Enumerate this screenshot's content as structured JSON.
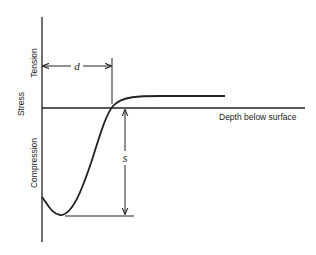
{
  "diagram": {
    "y_axis": {
      "label": "Stress",
      "upper_label": "Tension",
      "lower_label": "Compression"
    },
    "x_axis": {
      "label": "Depth below surface"
    },
    "dimensions": {
      "depth_symbol": "d",
      "stress_symbol": "s"
    },
    "line_color": "#222222",
    "curve_description": "Stress starts in compression at the surface, dips to a compressive minimum, rises to cross zero at depth d, then levels off at a slight tensile plateau"
  }
}
